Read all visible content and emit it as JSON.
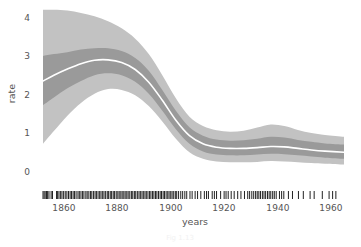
{
  "chart_data": {
    "type": "line",
    "title": "",
    "xlabel": "years",
    "ylabel": "rate",
    "xlim": [
      1851,
      1962
    ],
    "ylim": [
      -0.25,
      4.35
    ],
    "grid": false,
    "legend": "none",
    "xticks": [
      1860,
      1880,
      1900,
      1920,
      1940,
      1960
    ],
    "xtick_labels": [
      "1860",
      "1880",
      "1900",
      "1920",
      "1940",
      "1960"
    ],
    "yticks": [
      0,
      1,
      2,
      3,
      4
    ],
    "ytick_labels": [
      "0",
      "1",
      "2",
      "3",
      "4"
    ],
    "series": [
      {
        "name": "posterior mean rate",
        "style": "white-line",
        "color": "#ffffff",
        "x": [
          1851,
          1855,
          1860,
          1865,
          1870,
          1875,
          1880,
          1885,
          1890,
          1895,
          1900,
          1905,
          1910,
          1915,
          1920,
          1925,
          1930,
          1935,
          1940,
          1945,
          1950,
          1955,
          1962
        ],
        "y": [
          2.35,
          2.5,
          2.66,
          2.8,
          2.89,
          2.9,
          2.83,
          2.65,
          2.32,
          1.85,
          1.33,
          0.93,
          0.72,
          0.63,
          0.6,
          0.6,
          0.62,
          0.65,
          0.64,
          0.6,
          0.56,
          0.53,
          0.5
        ]
      },
      {
        "name": "inner band upper",
        "style": "band",
        "color": "#9a9a9a",
        "x": [
          1851,
          1855,
          1860,
          1865,
          1870,
          1875,
          1880,
          1885,
          1890,
          1895,
          1900,
          1905,
          1910,
          1915,
          1920,
          1925,
          1930,
          1935,
          1940,
          1945,
          1950,
          1955,
          1962
        ],
        "y": [
          3.0,
          3.05,
          3.1,
          3.17,
          3.2,
          3.2,
          3.13,
          2.95,
          2.62,
          2.12,
          1.58,
          1.15,
          0.93,
          0.83,
          0.8,
          0.81,
          0.85,
          0.9,
          0.88,
          0.82,
          0.77,
          0.73,
          0.7
        ]
      },
      {
        "name": "inner band lower",
        "style": "band",
        "color": "#9a9a9a",
        "x": [
          1851,
          1855,
          1860,
          1865,
          1870,
          1875,
          1880,
          1885,
          1890,
          1895,
          1900,
          1905,
          1910,
          1915,
          1920,
          1925,
          1930,
          1935,
          1940,
          1945,
          1950,
          1955,
          1962
        ],
        "y": [
          1.72,
          1.92,
          2.16,
          2.35,
          2.5,
          2.55,
          2.5,
          2.33,
          2.02,
          1.58,
          1.1,
          0.72,
          0.52,
          0.44,
          0.42,
          0.42,
          0.44,
          0.46,
          0.45,
          0.42,
          0.39,
          0.36,
          0.33
        ]
      },
      {
        "name": "outer band upper",
        "style": "band",
        "color": "#c2c2c2",
        "x": [
          1851,
          1855,
          1860,
          1865,
          1870,
          1875,
          1880,
          1885,
          1890,
          1895,
          1900,
          1905,
          1910,
          1915,
          1920,
          1925,
          1930,
          1935,
          1940,
          1945,
          1950,
          1955,
          1962
        ],
        "y": [
          4.2,
          4.2,
          4.18,
          4.12,
          4.03,
          3.9,
          3.72,
          3.45,
          3.05,
          2.5,
          1.9,
          1.42,
          1.18,
          1.07,
          1.03,
          1.06,
          1.14,
          1.22,
          1.18,
          1.08,
          1.0,
          0.95,
          0.9
        ]
      },
      {
        "name": "outer band lower",
        "style": "band",
        "color": "#c2c2c2",
        "x": [
          1851,
          1855,
          1860,
          1865,
          1870,
          1875,
          1880,
          1885,
          1890,
          1895,
          1900,
          1905,
          1910,
          1915,
          1920,
          1925,
          1930,
          1935,
          1940,
          1945,
          1950,
          1955,
          1962
        ],
        "y": [
          0.72,
          1.05,
          1.45,
          1.78,
          2.02,
          2.14,
          2.12,
          1.98,
          1.7,
          1.3,
          0.85,
          0.5,
          0.33,
          0.26,
          0.24,
          0.24,
          0.25,
          0.27,
          0.26,
          0.24,
          0.22,
          0.2,
          0.18
        ]
      }
    ],
    "rug": {
      "name": "event rug",
      "y_position": 195,
      "color": "#222222",
      "values": [
        1851,
        1851.4,
        1851.8,
        1852.3,
        1852.7,
        1853.2,
        1854.0,
        1854.5,
        1856.0,
        1856.4,
        1856.9,
        1857.5,
        1858.0,
        1858.6,
        1859.2,
        1859.8,
        1860.4,
        1861.0,
        1861.5,
        1862.1,
        1862.6,
        1863.2,
        1863.9,
        1864.4,
        1865.0,
        1865.6,
        1866.1,
        1866.8,
        1867.3,
        1867.9,
        1868.5,
        1869.0,
        1869.6,
        1870.2,
        1870.7,
        1871.3,
        1871.9,
        1872.4,
        1873.0,
        1873.5,
        1874.1,
        1874.7,
        1875.2,
        1875.8,
        1876.3,
        1876.9,
        1877.4,
        1878.0,
        1878.6,
        1879.1,
        1879.7,
        1880.2,
        1880.8,
        1881.3,
        1881.9,
        1882.4,
        1883.0,
        1883.6,
        1884.1,
        1884.7,
        1885.2,
        1885.8,
        1886.4,
        1886.9,
        1887.5,
        1888.0,
        1888.6,
        1889.1,
        1889.7,
        1890.3,
        1890.8,
        1891.4,
        1891.9,
        1892.5,
        1893.0,
        1893.6,
        1894.2,
        1894.7,
        1895.3,
        1895.8,
        1896.4,
        1897.0,
        1897.5,
        1898.1,
        1898.6,
        1899.2,
        1899.8,
        1900.3,
        1901.0,
        1901.8,
        1902.5,
        1903.3,
        1904.0,
        1905.2,
        1906.0,
        1907.1,
        1908.0,
        1909.2,
        1910.5,
        1911.3,
        1912.0,
        1913.4,
        1914.2,
        1915.0,
        1916.5,
        1917.8,
        1918.5,
        1919.3,
        1920.4,
        1921.5,
        1922.8,
        1924.0,
        1925.3,
        1926.5,
        1927.2,
        1928.0,
        1928.7,
        1929.4,
        1930.0,
        1930.6,
        1931.2,
        1931.9,
        1932.5,
        1933.1,
        1933.8,
        1934.4,
        1935.0,
        1935.7,
        1936.3,
        1937.0,
        1938.2,
        1939.0,
        1939.8,
        1941.5,
        1943.0,
        1945.2,
        1947.0,
        1949.5,
        1951.0,
        1954.0,
        1956.5,
        1957.8,
        1959.0
      ]
    }
  },
  "caption": {
    "text": "Fig 1.13"
  }
}
